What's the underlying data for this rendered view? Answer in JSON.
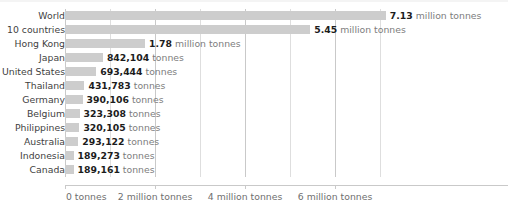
{
  "chart_data": {
    "type": "bar",
    "orientation": "horizontal",
    "title": "",
    "xlabel": "",
    "ylabel": "",
    "xlim": [
      0,
      7800000
    ],
    "grid": true,
    "grid_interval": 1000000,
    "legend": "none",
    "categories": [
      "World",
      "10 countries",
      "Hong Kong",
      "Japan",
      "United States",
      "Thailand",
      "Germany",
      "Belgium",
      "Philippines",
      "Australia",
      "Indonesia",
      "Canada"
    ],
    "values": [
      7130000,
      5450000,
      1780000,
      842104,
      693444,
      431783,
      390106,
      323308,
      320105,
      293122,
      189273,
      189161
    ],
    "value_labels": [
      {
        "number": "7.13",
        "unit": "million tonnes"
      },
      {
        "number": "5.45",
        "unit": "million tonnes"
      },
      {
        "number": "1.78",
        "unit": "million tonnes"
      },
      {
        "number": "842,104",
        "unit": "tonnes"
      },
      {
        "number": "693,444",
        "unit": "tonnes"
      },
      {
        "number": "431,783",
        "unit": "tonnes"
      },
      {
        "number": "390,106",
        "unit": "tonnes"
      },
      {
        "number": "323,308",
        "unit": "tonnes"
      },
      {
        "number": "320,105",
        "unit": "tonnes"
      },
      {
        "number": "293,122",
        "unit": "tonnes"
      },
      {
        "number": "189,273",
        "unit": "tonnes"
      },
      {
        "number": "189,161",
        "unit": "tonnes"
      }
    ],
    "xticks": [
      0,
      2000000,
      4000000,
      6000000
    ],
    "xticklabels": [
      "0 tonnes",
      "2 million tonnes",
      "4 million tonnes",
      "6 million tonnes"
    ]
  },
  "style": {
    "bar_color": "#cdcdcd",
    "grid_color": "#c9c9c9",
    "minor_grid_color": "#dedede",
    "label_color": "#3f3f3f",
    "value_number_color": "#1c1c1c",
    "value_unit_color": "#7d7d7d",
    "tick_label_color": "#6f6f6f",
    "background": "#ffffff"
  }
}
